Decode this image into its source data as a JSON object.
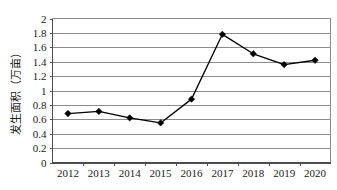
{
  "chart_data": {
    "type": "line",
    "title": "",
    "xlabel": "",
    "ylabel": "发生面积（万亩）",
    "categories": [
      "2012",
      "2013",
      "2014",
      "2015",
      "2016",
      "2017",
      "2018",
      "2019",
      "2020"
    ],
    "values": [
      0.68,
      0.71,
      0.62,
      0.55,
      0.88,
      1.78,
      1.51,
      1.36,
      1.42
    ],
    "series": [
      {
        "name": "发生面积（万亩）",
        "values": [
          0.68,
          0.71,
          0.62,
          0.55,
          0.88,
          1.78,
          1.51,
          1.36,
          1.42
        ]
      }
    ],
    "ylim": [
      0,
      2
    ],
    "ytick_labels": [
      "0",
      "0.2",
      "0.4",
      "0.6",
      "0.8",
      "1",
      "1.2",
      "1.4",
      "1.6",
      "1.8",
      "2"
    ],
    "ytick_values": [
      0,
      0.2,
      0.4,
      0.6,
      0.8,
      1,
      1.2,
      1.4,
      1.6,
      1.8,
      2
    ],
    "xtick_labels": [
      "2012",
      "2013",
      "2014",
      "2015",
      "2016",
      "2017",
      "2018",
      "2019",
      "2020"
    ],
    "grid": "horizontal",
    "legend": "none",
    "marker": "diamond",
    "line_color": "#000000",
    "marker_color": "#000000",
    "grid_color": "#8c8c8c",
    "axis_color": "#4d4d4d",
    "background": "#ffffff"
  }
}
